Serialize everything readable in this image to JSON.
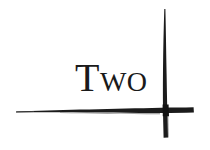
{
  "canvas": {
    "width": 210,
    "height": 150,
    "background_color": "#ffffff",
    "ink_color": "#1b1b1b",
    "text_color": "#1a1a1a"
  },
  "artwork": {
    "name": "two-ink-cross",
    "word": "Two",
    "word_style": "serif-small-caps",
    "strokes": [
      {
        "name": "horizontal-brush-stroke",
        "orientation": "horizontal",
        "x_start": 16,
        "x_end": 194,
        "y": 109,
        "thickness_start": 1,
        "thickness_end": 6
      },
      {
        "name": "vertical-brush-stroke",
        "orientation": "vertical",
        "x": 165,
        "y_start": 9,
        "y_end": 138,
        "thickness_start": 1,
        "thickness_end": 5
      }
    ],
    "crossing_point": {
      "x": 166,
      "y": 109
    }
  }
}
